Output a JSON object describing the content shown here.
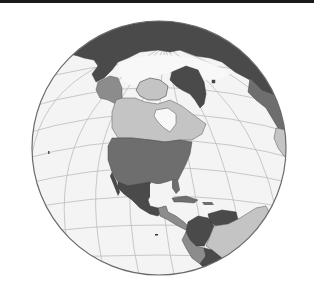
{
  "map": {
    "projection": "orthographic",
    "center_region": "North America",
    "style": "grayscale",
    "colors": {
      "ocean": "#f4f4f4",
      "graticule": "#bdbdbd",
      "outline": "#6a6a6a",
      "land_dark": "#4a4a4a",
      "land_medium_dark": "#6e6e6e",
      "land_medium": "#8c8c8c",
      "land_light": "#c4c4c4",
      "ice": "#f8f8f8",
      "top_bar": "#1a1a1a"
    },
    "regions": [
      {
        "name": "Russia",
        "shade": "land_dark"
      },
      {
        "name": "Greenland",
        "shade": "land_dark"
      },
      {
        "name": "Alaska",
        "shade": "land_medium"
      },
      {
        "name": "Canada",
        "shade": "land_light"
      },
      {
        "name": "United States",
        "shade": "land_medium_dark"
      },
      {
        "name": "Mexico",
        "shade": "land_dark"
      },
      {
        "name": "Central America",
        "shade": "land_medium"
      },
      {
        "name": "Colombia",
        "shade": "land_dark"
      },
      {
        "name": "Venezuela",
        "shade": "land_dark"
      },
      {
        "name": "Brazil",
        "shade": "land_light"
      },
      {
        "name": "Peru",
        "shade": "land_medium"
      },
      {
        "name": "Europe",
        "shade": "land_medium_dark"
      },
      {
        "name": "Africa",
        "shade": "land_light"
      }
    ]
  }
}
